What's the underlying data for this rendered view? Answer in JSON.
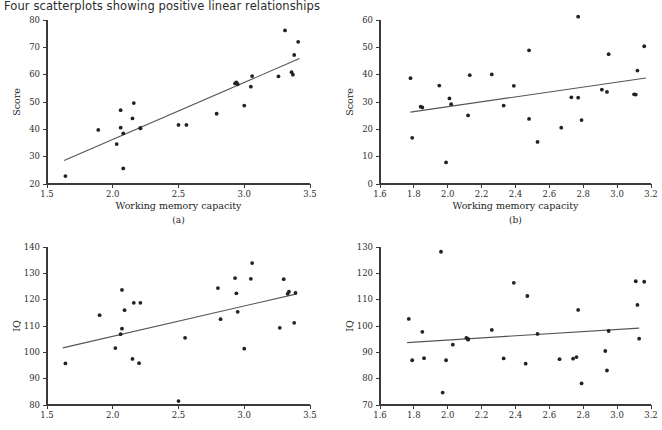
{
  "figure": {
    "title": "Four scatterplots showing positive linear relationships",
    "point_color": "#222222",
    "line_color": "#555555",
    "axis_color": "#3a3a3a"
  },
  "chart_data": [
    {
      "id": "panel-a",
      "type": "scatter",
      "title": "",
      "caption": "(a)",
      "xlabel": "Working memory capacity",
      "ylabel": "Score",
      "xlim": [
        1.5,
        3.5
      ],
      "ylim": [
        20,
        80
      ],
      "xticks": [
        "1.5",
        "2.0",
        "2.5",
        "3.0",
        "3.5"
      ],
      "xtick_values": [
        1.5,
        2.0,
        2.5,
        3.0,
        3.5
      ],
      "yticks": [
        "20",
        "30",
        "40",
        "50",
        "60",
        "70",
        "80"
      ],
      "ytick_values": [
        20,
        30,
        40,
        50,
        60,
        70,
        80
      ],
      "grid": false,
      "legend": "none",
      "trendline": {
        "x0": 1.63,
        "y0": 28.6,
        "x1": 3.42,
        "y1": 65.9
      },
      "x": [
        1.64,
        1.89,
        2.03,
        2.06,
        2.06,
        2.08,
        2.08,
        2.15,
        2.16,
        2.21,
        2.21,
        2.5,
        2.56,
        2.79,
        2.93,
        2.94,
        2.95,
        3.0,
        3.05,
        3.06,
        3.26,
        3.31,
        3.36,
        3.37,
        3.38,
        3.41
      ],
      "y": [
        22.9,
        39.8,
        34.6,
        40.6,
        47.0,
        25.7,
        38.5,
        44.0,
        49.6,
        40.4,
        40.4,
        41.6,
        41.6,
        45.7,
        56.8,
        57.2,
        56.5,
        48.7,
        55.6,
        59.5,
        59.4,
        76.2,
        60.9,
        60.0,
        67.2,
        72.0
      ]
    },
    {
      "id": "panel-b",
      "type": "scatter",
      "title": "",
      "caption": "(b)",
      "xlabel": "Working memory capacity",
      "ylabel": "Score",
      "xlim": [
        1.6,
        3.2
      ],
      "ylim": [
        0,
        60
      ],
      "xticks": [
        "1.6",
        "1.8",
        "2.0",
        "2.2",
        "2.4",
        "2.6",
        "2.8",
        "3.0",
        "3.2"
      ],
      "xtick_values": [
        1.6,
        1.8,
        2.0,
        2.2,
        2.4,
        2.6,
        2.8,
        3.0,
        3.2
      ],
      "yticks": [
        "0",
        "10",
        "20",
        "30",
        "40",
        "50",
        "60"
      ],
      "ytick_values": [
        0,
        10,
        20,
        30,
        40,
        50,
        60
      ],
      "grid": false,
      "legend": "none",
      "trendline": {
        "x0": 1.78,
        "y0": 26.3,
        "x1": 3.17,
        "y1": 38.8
      },
      "x": [
        1.78,
        1.79,
        1.84,
        1.85,
        1.95,
        1.99,
        2.01,
        2.02,
        2.12,
        2.13,
        2.26,
        2.33,
        2.39,
        2.48,
        2.48,
        2.53,
        2.67,
        2.73,
        2.77,
        2.77,
        2.79,
        2.91,
        2.94,
        2.95,
        3.1,
        3.11,
        3.12,
        3.16
      ],
      "y": [
        38.7,
        16.9,
        28.3,
        28.0,
        36.0,
        7.9,
        31.3,
        29.2,
        25.1,
        39.8,
        40.1,
        28.7,
        35.9,
        48.9,
        23.8,
        15.4,
        20.6,
        31.7,
        61.2,
        31.6,
        23.4,
        34.5,
        33.7,
        47.5,
        32.8,
        32.7,
        41.5,
        50.4
      ]
    },
    {
      "id": "panel-c",
      "type": "scatter",
      "title": "",
      "caption": "",
      "xlabel": "",
      "ylabel": "IQ",
      "xlim": [
        1.5,
        3.5
      ],
      "ylim": [
        80,
        140
      ],
      "xticks": [
        "1.5",
        "2.0",
        "2.5",
        "3.0",
        "3.5"
      ],
      "xtick_values": [
        1.5,
        2.0,
        2.5,
        3.0,
        3.5
      ],
      "yticks": [
        "80",
        "90",
        "100",
        "110",
        "120",
        "130",
        "140"
      ],
      "ytick_values": [
        80,
        90,
        100,
        110,
        120,
        130,
        140
      ],
      "grid": false,
      "legend": "none",
      "trendline": {
        "x0": 1.62,
        "y0": 101.7,
        "x1": 3.4,
        "y1": 122.2
      },
      "x": [
        1.64,
        1.9,
        2.02,
        2.06,
        2.07,
        2.07,
        2.09,
        2.15,
        2.16,
        2.2,
        2.21,
        2.5,
        2.55,
        2.8,
        2.82,
        2.93,
        2.94,
        2.95,
        3.0,
        3.05,
        3.06,
        3.27,
        3.3,
        3.33,
        3.34,
        3.38,
        3.39
      ],
      "y": [
        95.8,
        114.1,
        101.6,
        106.9,
        109.0,
        123.7,
        116.0,
        97.5,
        118.8,
        95.9,
        118.8,
        81.5,
        105.5,
        124.4,
        112.6,
        128.2,
        122.4,
        115.4,
        101.4,
        127.9,
        133.9,
        109.3,
        127.8,
        122.2,
        123.0,
        111.2,
        122.6
      ]
    },
    {
      "id": "panel-d",
      "type": "scatter",
      "title": "",
      "caption": "",
      "xlabel": "",
      "ylabel": "IQ",
      "xlim": [
        1.6,
        3.2
      ],
      "ylim": [
        70,
        130
      ],
      "xticks": [
        "1.6",
        "1.8",
        "2.0",
        "2.2",
        "2.4",
        "2.6",
        "2.8",
        "3.0",
        "3.2"
      ],
      "xtick_values": [
        1.6,
        1.8,
        2.0,
        2.2,
        2.4,
        2.6,
        2.8,
        3.0,
        3.2
      ],
      "yticks": [
        "70",
        "80",
        "90",
        "100",
        "110",
        "120",
        "130"
      ],
      "ytick_values": [
        70,
        80,
        90,
        100,
        110,
        120,
        130
      ],
      "grid": false,
      "legend": "none",
      "trendline": {
        "x0": 1.76,
        "y0": 93.7,
        "x1": 3.13,
        "y1": 99.2
      },
      "x": [
        1.77,
        1.79,
        1.85,
        1.86,
        1.96,
        1.97,
        1.99,
        2.03,
        2.11,
        2.12,
        2.12,
        2.26,
        2.33,
        2.39,
        2.46,
        2.47,
        2.53,
        2.66,
        2.74,
        2.76,
        2.77,
        2.79,
        2.93,
        2.94,
        2.95,
        3.11,
        3.12,
        3.13,
        3.16
      ],
      "y": [
        102.7,
        87.0,
        97.8,
        87.8,
        128.2,
        74.7,
        87.0,
        92.9,
        95.5,
        94.8,
        95.1,
        98.5,
        87.7,
        116.4,
        85.7,
        111.4,
        97.0,
        87.4,
        87.6,
        88.2,
        106.1,
        78.2,
        90.5,
        83.1,
        98.1,
        117.0,
        108.0,
        95.2,
        116.8
      ]
    }
  ]
}
